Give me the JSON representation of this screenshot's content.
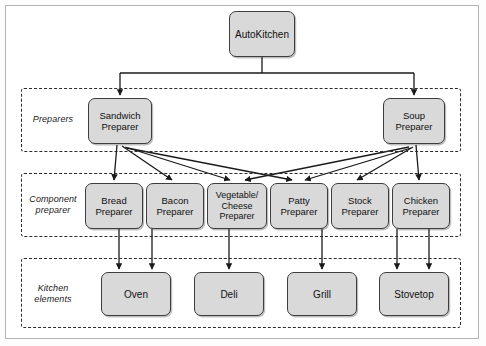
{
  "diagram": {
    "type": "layered-block-diagram",
    "colors": {
      "node_fill": "#d9d9d9",
      "node_border": "#3d3d3d",
      "band_border": "#2b2b2b",
      "frame_border": "#b4b4b4",
      "connector": "#1a1a1a",
      "text": "#101010",
      "background": "#ffffff"
    },
    "root": {
      "id": "autokitchen",
      "label": "AutoKitchen",
      "x": 229,
      "y": 11,
      "w": 66,
      "h": 46
    },
    "bands": [
      {
        "id": "preparers",
        "label": "Preparers",
        "label_lines": [
          "Preparers"
        ],
        "x": 21,
        "y": 88,
        "w": 440,
        "h": 64,
        "label_x": 28,
        "label_y": 114
      },
      {
        "id": "component-preparer",
        "label": "Component preparer",
        "label_lines": [
          "Component",
          "preparer"
        ],
        "x": 21,
        "y": 173,
        "w": 440,
        "h": 64,
        "label_x": 24,
        "label_y": 194
      },
      {
        "id": "kitchen-elements",
        "label": "Kitchen elements",
        "label_lines": [
          "Kitchen",
          "elements"
        ],
        "x": 21,
        "y": 258,
        "w": 440,
        "h": 70,
        "label_x": 26,
        "label_y": 283
      }
    ],
    "nodes": [
      {
        "id": "sandwich-preparer",
        "label": "Sandwich\nPreparer",
        "band": "preparers",
        "x": 88,
        "y": 98,
        "w": 64,
        "h": 46
      },
      {
        "id": "soup-preparer",
        "label": "Soup\nPreparer",
        "band": "preparers",
        "x": 383,
        "y": 98,
        "w": 62,
        "h": 46
      },
      {
        "id": "bread-preparer",
        "label": "Bread\nPreparer",
        "band": "component-preparer",
        "x": 85,
        "y": 183,
        "w": 58,
        "h": 46
      },
      {
        "id": "bacon-preparer",
        "label": "Bacon\nPreparer",
        "band": "component-preparer",
        "x": 146,
        "y": 183,
        "w": 58,
        "h": 46
      },
      {
        "id": "vegetable-cheese-preparer",
        "label": "Vegetable/\nCheese\nPreparer",
        "band": "component-preparer",
        "x": 207,
        "y": 183,
        "w": 60,
        "h": 46
      },
      {
        "id": "patty-preparer",
        "label": "Patty\nPreparer",
        "band": "component-preparer",
        "x": 270,
        "y": 183,
        "w": 58,
        "h": 46
      },
      {
        "id": "stock-preparer",
        "label": "Stock\nPreparer",
        "band": "component-preparer",
        "x": 331,
        "y": 183,
        "w": 58,
        "h": 46
      },
      {
        "id": "chicken-preparer",
        "label": "Chicken\nPreparer",
        "band": "component-preparer",
        "x": 392,
        "y": 183,
        "w": 58,
        "h": 46
      },
      {
        "id": "oven",
        "label": "Oven",
        "band": "kitchen-elements",
        "x": 101,
        "y": 272,
        "w": 70,
        "h": 44
      },
      {
        "id": "deli",
        "label": "Deli",
        "band": "kitchen-elements",
        "x": 194,
        "y": 272,
        "w": 70,
        "h": 44
      },
      {
        "id": "grill",
        "label": "Grill",
        "band": "kitchen-elements",
        "x": 287,
        "y": 272,
        "w": 70,
        "h": 44
      },
      {
        "id": "stovetop",
        "label": "Stovetop",
        "band": "kitchen-elements",
        "x": 379,
        "y": 272,
        "w": 70,
        "h": 44
      }
    ],
    "edges": [
      {
        "from": "autokitchen",
        "to": "sandwich-preparer",
        "style": "orthogonal"
      },
      {
        "from": "autokitchen",
        "to": "soup-preparer",
        "style": "orthogonal"
      },
      {
        "from": "sandwich-preparer",
        "to": "bread-preparer",
        "style": "straight"
      },
      {
        "from": "sandwich-preparer",
        "to": "bacon-preparer",
        "style": "straight"
      },
      {
        "from": "sandwich-preparer",
        "to": "vegetable-cheese-preparer",
        "style": "straight"
      },
      {
        "from": "sandwich-preparer",
        "to": "patty-preparer",
        "style": "straight"
      },
      {
        "from": "soup-preparer",
        "to": "vegetable-cheese-preparer",
        "style": "straight"
      },
      {
        "from": "soup-preparer",
        "to": "patty-preparer",
        "style": "straight"
      },
      {
        "from": "soup-preparer",
        "to": "stock-preparer",
        "style": "straight"
      },
      {
        "from": "soup-preparer",
        "to": "chicken-preparer",
        "style": "straight"
      },
      {
        "from": "bread-preparer",
        "to": "oven",
        "style": "straight"
      },
      {
        "from": "bacon-preparer",
        "to": "oven",
        "style": "straight"
      },
      {
        "from": "vegetable-cheese-preparer",
        "to": "deli",
        "style": "straight"
      },
      {
        "from": "patty-preparer",
        "to": "grill",
        "style": "straight"
      },
      {
        "from": "stock-preparer",
        "to": "stovetop",
        "style": "straight"
      },
      {
        "from": "chicken-preparer",
        "to": "stovetop",
        "style": "straight"
      }
    ]
  }
}
